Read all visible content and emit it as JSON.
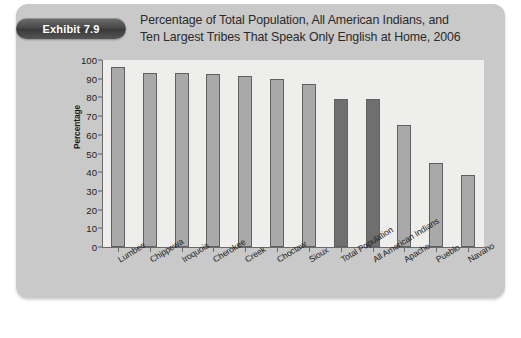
{
  "exhibit": {
    "badge_label": "Exhibit 7.9"
  },
  "title": {
    "line1": "Percentage of Total Population, All American Indians, and",
    "line2": "Ten Largest Tribes That Speak Only English at Home, 2006"
  },
  "colors": {
    "panel_background": "#c9c9c9",
    "plot_background": "#eeeeec",
    "bar_light": "#a9a9a9",
    "bar_dark": "#6f6f6f",
    "bar_border": "#606060",
    "axis": "#6a6a6a",
    "text": "#1d1d1d",
    "badge_text": "#ffffff"
  },
  "chart_data": {
    "type": "bar",
    "title": "Percentage of Total Population, All American Indians, and Ten Largest Tribes That Speak Only English at Home, 2006",
    "xlabel": "",
    "ylabel": "Percentage",
    "ylim": [
      0,
      100
    ],
    "yticks": [
      0,
      10,
      20,
      30,
      40,
      50,
      60,
      70,
      80,
      90,
      100
    ],
    "grid": false,
    "legend": "none",
    "categories": [
      "Lumbee",
      "Chippewa",
      "Iroquois",
      "Cherokee",
      "Creek",
      "Choctaw",
      "Sioux",
      "Total Population",
      "All American Indians",
      "Apache",
      "Pueblo",
      "Navaho"
    ],
    "values": [
      96,
      93,
      93,
      92.5,
      91.5,
      90,
      87,
      79,
      79,
      65,
      45,
      38.5
    ],
    "bar_shades": [
      "light",
      "light",
      "light",
      "light",
      "light",
      "light",
      "light",
      "dark",
      "dark",
      "light",
      "light",
      "light"
    ]
  }
}
